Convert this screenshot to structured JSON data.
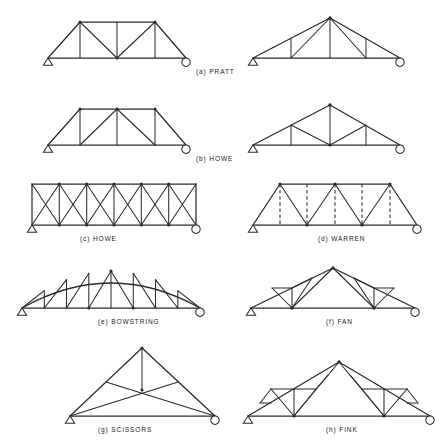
{
  "figure": {
    "background_color": "#ffffff",
    "line_color": "#2b2b2b",
    "support_left_type": "pinned",
    "support_right_type": "roller",
    "columns": 2,
    "rows": 4
  },
  "trusses": [
    {
      "key": "a",
      "label": "(a)  PRATT",
      "name": "pratt",
      "profile": "trapezoidal",
      "top_chord": "parallel",
      "web_pattern": "verticals with diagonals sloping toward center",
      "panels": 4,
      "dashed_members": false,
      "caption_x": 196,
      "caption_y": 74
    },
    {
      "key": "b",
      "label": "(b)  HOWE",
      "name": "howe-trapezoidal",
      "profile": "trapezoidal",
      "top_chord": "parallel",
      "web_pattern": "verticals with diagonals sloping away from center",
      "panels": 4,
      "dashed_members": false,
      "caption_x": 196,
      "caption_y": 161
    },
    {
      "key": "c",
      "label": "(c)  HOWE",
      "name": "howe-parallel-chord",
      "profile": "parallel chord",
      "top_chord": "parallel",
      "web_pattern": "cross bracing in each panel",
      "panels": 6,
      "dashed_members": false,
      "caption_x": 80,
      "caption_y": 241
    },
    {
      "key": "d",
      "label": "(d)  WARREN",
      "name": "warren",
      "profile": "trapezoidal",
      "top_chord": "parallel",
      "web_pattern": "zigzag diagonals with optional verticals",
      "panels": 6,
      "dashed_members": true,
      "caption_x": 318,
      "caption_y": 241
    },
    {
      "key": "e",
      "label": "(e)  BOWSTRING",
      "name": "bowstring",
      "profile": "arched",
      "top_chord": "curved",
      "web_pattern": "alternating verticals and diagonals under arch",
      "panels": 8,
      "dashed_members": false,
      "caption_x": 98,
      "caption_y": 324
    },
    {
      "key": "f",
      "label": "(f)  FAN",
      "name": "fan",
      "profile": "gabled",
      "top_chord": "pitched",
      "web_pattern": "members radiating from two bottom chord nodes",
      "panels": 6,
      "dashed_members": false,
      "caption_x": 326,
      "caption_y": 324
    },
    {
      "key": "g",
      "label": "(g)  SCISSORS",
      "name": "scissors",
      "profile": "gabled",
      "top_chord": "pitched",
      "web_pattern": "crossing ties from supports with central king post",
      "panels": 2,
      "dashed_members": false,
      "caption_x": 98,
      "caption_y": 432
    },
    {
      "key": "h",
      "label": "(h)  FINK",
      "name": "fink",
      "profile": "gabled",
      "top_chord": "pitched",
      "web_pattern": "recursively subdivided triangles",
      "panels": 8,
      "dashed_members": false,
      "caption_x": 326,
      "caption_y": 432
    }
  ]
}
